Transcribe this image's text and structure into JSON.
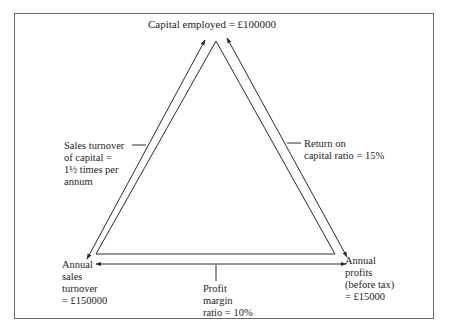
{
  "diagram": {
    "top_node": {
      "label": "Capital employed  =  £100000"
    },
    "left_edge": {
      "lines": [
        "Sales turnover",
        "of capital  =",
        "1½ times per",
        "annum"
      ]
    },
    "right_edge": {
      "lines": [
        "Return on",
        "capital ratio  =  15%"
      ]
    },
    "bottom_left_node": {
      "lines": [
        "Annual",
        "sales",
        "turnover",
        "=  £150000"
      ]
    },
    "bottom_right_node": {
      "lines": [
        "Annual",
        "profits",
        "(before tax)",
        "=  £15000"
      ]
    },
    "bottom_edge": {
      "lines": [
        "Profit",
        "margin",
        "ratio  =  10%"
      ]
    },
    "colors": {
      "line": "#2a2a2a",
      "frame": "#6b6b6b",
      "background": "#ffffff"
    }
  }
}
